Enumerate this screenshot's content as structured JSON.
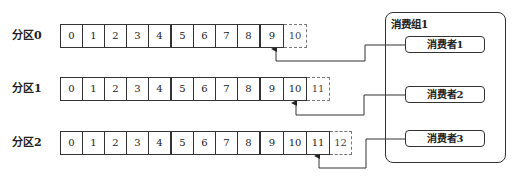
{
  "diagram": {
    "type": "kafka-partition-consumer-offsets",
    "partitions": [
      {
        "label": "分区0",
        "cells": [
          "0",
          "1",
          "2",
          "3",
          "4",
          "5",
          "6",
          "7",
          "8",
          "9"
        ],
        "next_cell": "10",
        "consumer": "消费者1",
        "committed_offset": "9"
      },
      {
        "label": "分区1",
        "cells": [
          "0",
          "1",
          "2",
          "3",
          "4",
          "5",
          "6",
          "7",
          "8",
          "9",
          "10"
        ],
        "next_cell": "11",
        "consumer": "消费者2",
        "committed_offset": "10"
      },
      {
        "label": "分区2",
        "cells": [
          "0",
          "1",
          "2",
          "3",
          "4",
          "5",
          "6",
          "7",
          "8",
          "9",
          "10",
          "11"
        ],
        "next_cell": "12",
        "consumer": "消费者3",
        "committed_offset": "11"
      }
    ],
    "group": {
      "title": "消费组1",
      "consumers": [
        "消费者1",
        "消费者2",
        "消费者3"
      ]
    },
    "colors": {
      "line": "#333333",
      "dashed": "#777777",
      "background": "#ffffff"
    }
  }
}
